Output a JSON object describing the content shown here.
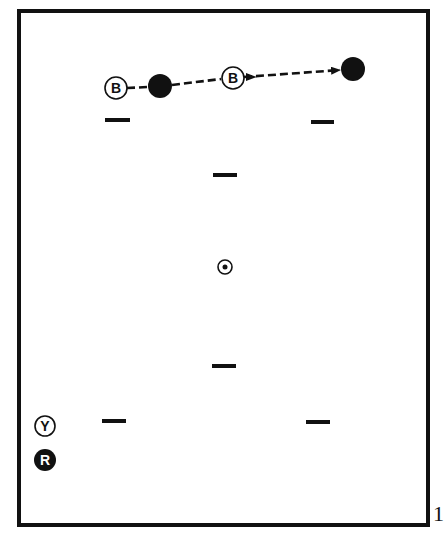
{
  "diagram": {
    "colors": {
      "ink": "#111111",
      "paper": "#ffffff"
    },
    "frame": {
      "x": 19,
      "y": 11,
      "w": 409,
      "h": 514,
      "stroke": 4
    },
    "path": {
      "style": "dashed",
      "segments": [
        {
          "from": [
            127,
            88
          ],
          "to": [
            148,
            87
          ],
          "arrow": false
        },
        {
          "from": [
            172,
            85
          ],
          "to": [
            221,
            79
          ],
          "arrow": false
        },
        {
          "from": [
            244,
            77
          ],
          "to": [
            340,
            70
          ],
          "arrow": true
        }
      ],
      "mid_arrow": {
        "at": [
          252,
          77
        ],
        "direction": "right"
      }
    },
    "balls": [
      {
        "id": "cue-ball-start",
        "label": "B",
        "x": 116,
        "y": 88,
        "r": 11,
        "fill": "outline"
      },
      {
        "id": "object-ball-1",
        "label": "",
        "x": 160,
        "y": 86,
        "r": 12,
        "fill": "solid"
      },
      {
        "id": "cue-ball-contact",
        "label": "B",
        "x": 233,
        "y": 78,
        "r": 11,
        "fill": "outline"
      },
      {
        "id": "object-ball-2",
        "label": "",
        "x": 353,
        "y": 69,
        "r": 12,
        "fill": "solid"
      },
      {
        "id": "yellow-ball",
        "label": "Y",
        "x": 45,
        "y": 426,
        "r": 10,
        "fill": "outline"
      },
      {
        "id": "red-ball",
        "label": "R",
        "x": 45,
        "y": 460,
        "r": 11,
        "fill": "solid"
      }
    ],
    "spot": {
      "x": 225,
      "y": 267,
      "r": 7,
      "dot_r": 2.5
    },
    "markers": [
      {
        "x1": 105,
        "x2": 130,
        "y": 120
      },
      {
        "x1": 311,
        "x2": 334,
        "y": 122
      },
      {
        "x1": 213,
        "x2": 237,
        "y": 175
      },
      {
        "x1": 212,
        "x2": 236,
        "y": 366
      },
      {
        "x1": 102,
        "x2": 126,
        "y": 421
      },
      {
        "x1": 306,
        "x2": 330,
        "y": 422
      }
    ],
    "edge_label": "1"
  }
}
